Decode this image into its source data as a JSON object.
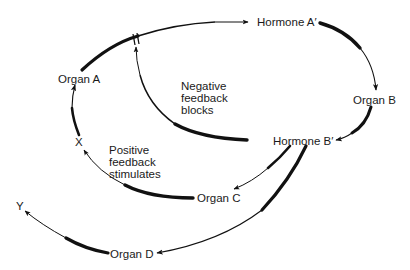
{
  "diagram": {
    "type": "hormone-feedback-loop",
    "nodes": {
      "hormone_a": "Hormone A′",
      "organ_a": "Organ A",
      "organ_b": "Organ B",
      "hormone_b": "Hormone B′",
      "organ_c": "Organ C",
      "organ_d": "Organ D",
      "x": "X",
      "y": "Y"
    },
    "annotations": {
      "negative": [
        "Negative",
        "feedback",
        "blocks"
      ],
      "positive": [
        "Positive",
        "feedback",
        "stimulates"
      ]
    },
    "edges": [
      {
        "from": "Organ A",
        "to": "Hormone A′",
        "style": "tapered arrow"
      },
      {
        "from": "Hormone A′",
        "to": "Organ B",
        "style": "tapered arrow"
      },
      {
        "from": "Organ B",
        "to": "Hormone B′",
        "style": "tapered arrow"
      },
      {
        "from": "Hormone B′",
        "to": "Organ A→Hormone A′ pathway",
        "style": "negative feedback, blocked (//)"
      },
      {
        "from": "Hormone B′",
        "to": "Organ C",
        "style": "tapered arrow"
      },
      {
        "from": "Hormone B′",
        "to": "Organ D",
        "style": "tapered arrow"
      },
      {
        "from": "Organ C",
        "to": "X",
        "style": "tapered arrow"
      },
      {
        "from": "X",
        "to": "Organ A",
        "style": "positive feedback"
      },
      {
        "from": "Organ D",
        "to": "Y",
        "style": "tapered arrow"
      }
    ],
    "colors": {
      "ink": "#111111",
      "background": "#ffffff"
    }
  }
}
